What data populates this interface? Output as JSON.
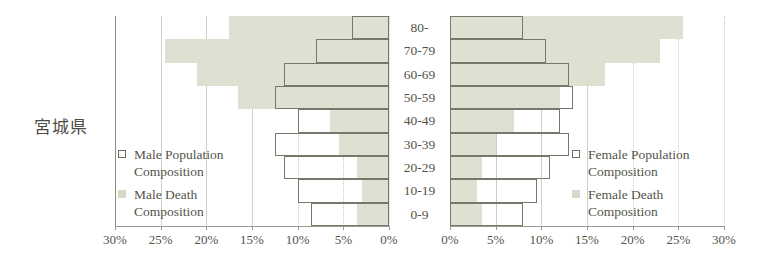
{
  "title": "宮城県",
  "colors": {
    "death_fill": "#dfe0d2",
    "population_stroke": "#77776c",
    "axis": "#9b9b90",
    "grid": "#cfcfc6",
    "text": "#53534a"
  },
  "legend_male": {
    "population": {
      "label_line1": "Male Population",
      "label_line2": "Composition",
      "swatch": "population-square-outline"
    },
    "death": {
      "label_line1": "Male Death",
      "label_line2": "Composition",
      "swatch": "death-square-filled"
    }
  },
  "legend_female": {
    "population": {
      "label_line1": "Female Population",
      "label_line2": "Composition",
      "swatch": "population-square-outline"
    },
    "death": {
      "label_line1": "Female Death",
      "label_line2": "Composition",
      "swatch": "death-square-filled"
    }
  },
  "axis": {
    "male_ticks": [
      "30%",
      "25%",
      "20%",
      "15%",
      "10%",
      "5%",
      "0%"
    ],
    "female_ticks": [
      "0%",
      "5%",
      "10%",
      "15%",
      "20%",
      "25%",
      "30%"
    ]
  },
  "chart_data": {
    "type": "bar",
    "title": "宮城県",
    "subtitle": "",
    "xlabel": "",
    "ylabel": "",
    "orientation": "horizontal",
    "layout": "population-pyramid",
    "xlim": [
      0,
      30
    ],
    "xunit": "%",
    "grid": true,
    "legend_position": "inside-left-and-right",
    "categories": [
      "80-",
      "70-79",
      "60-69",
      "50-59",
      "40-49",
      "30-39",
      "20-29",
      "10-19",
      "0-9"
    ],
    "series": [
      {
        "name": "Male Population Composition",
        "side": "left",
        "style": "outline",
        "values": [
          4.0,
          8.0,
          11.5,
          12.5,
          10.0,
          12.5,
          11.5,
          10.0,
          8.5
        ]
      },
      {
        "name": "Male Death Composition",
        "side": "left",
        "style": "filled",
        "values": [
          17.5,
          24.5,
          21.0,
          16.5,
          6.5,
          5.5,
          3.5,
          3.0,
          3.5
        ]
      },
      {
        "name": "Female Population Composition",
        "side": "right",
        "style": "outline",
        "values": [
          8.0,
          10.5,
          13.0,
          13.5,
          12.0,
          13.0,
          11.0,
          9.5,
          8.0
        ]
      },
      {
        "name": "Female Death Composition",
        "side": "right",
        "style": "filled",
        "values": [
          25.5,
          23.0,
          17.0,
          12.0,
          7.0,
          5.0,
          3.5,
          3.0,
          3.5
        ]
      }
    ]
  }
}
